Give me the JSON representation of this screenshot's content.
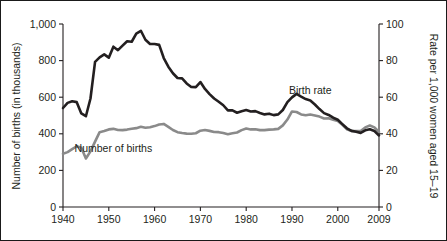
{
  "chart_data": {
    "type": "line",
    "title": "",
    "xlabel": "",
    "ylabel": "Number of births (in thousands)",
    "y2label": "Rate per 1,000 women aged 15–19",
    "grid": false,
    "legend_position": "inline-annotations",
    "xlim": [
      1940,
      2009
    ],
    "ylim": [
      0,
      1000
    ],
    "y2lim": [
      0,
      100
    ],
    "x_ticks": [
      "1940",
      "1950",
      "1960",
      "1970",
      "1980",
      "1990",
      "2000",
      "2009"
    ],
    "x_tick_values": [
      1940,
      1950,
      1960,
      1970,
      1980,
      1990,
      2000,
      2009
    ],
    "y_ticks": [
      "0",
      "200",
      "400",
      "600",
      "800",
      "1,000"
    ],
    "y_tick_values": [
      0,
      200,
      400,
      600,
      800,
      1000
    ],
    "y2_ticks": [
      "0",
      "20",
      "40",
      "60",
      "80",
      "100"
    ],
    "y2_tick_values": [
      0,
      20,
      40,
      60,
      80,
      100
    ],
    "x": [
      1940,
      1941,
      1942,
      1943,
      1944,
      1945,
      1946,
      1947,
      1948,
      1949,
      1950,
      1951,
      1952,
      1953,
      1954,
      1955,
      1956,
      1957,
      1958,
      1959,
      1960,
      1961,
      1962,
      1963,
      1964,
      1965,
      1966,
      1967,
      1968,
      1969,
      1970,
      1971,
      1972,
      1973,
      1974,
      1975,
      1976,
      1977,
      1978,
      1979,
      1980,
      1981,
      1982,
      1983,
      1984,
      1985,
      1986,
      1987,
      1988,
      1989,
      1990,
      1991,
      1992,
      1993,
      1994,
      1995,
      1996,
      1997,
      1998,
      1999,
      2000,
      2001,
      2002,
      2003,
      2004,
      2005,
      2006,
      2007,
      2008,
      2009
    ],
    "series": [
      {
        "name": "Birth rate",
        "axis": "right",
        "color": "#231f20",
        "units": "births per 1,000 women aged 15-19",
        "values": [
          54.1,
          56.9,
          57.8,
          57.3,
          51.1,
          49.6,
          59.3,
          79.3,
          81.8,
          83.4,
          81.6,
          87.6,
          85.7,
          88.2,
          90.6,
          90.3,
          94.8,
          96.3,
          91.4,
          89.1,
          89.1,
          88.6,
          81.4,
          76.7,
          73.1,
          70.5,
          70.3,
          67.5,
          65.6,
          65.5,
          68.3,
          64.5,
          61.7,
          59.3,
          57.5,
          55.6,
          52.8,
          52.8,
          51.5,
          52.3,
          53.0,
          52.2,
          52.4,
          51.4,
          50.6,
          51.0,
          50.2,
          50.6,
          53.0,
          57.3,
          59.9,
          61.8,
          60.3,
          59.0,
          58.2,
          56.0,
          53.5,
          51.3,
          50.3,
          48.8,
          47.7,
          45.3,
          43.0,
          41.6,
          41.1,
          40.5,
          41.9,
          42.5,
          41.5,
          39.1
        ]
      },
      {
        "name": "Number of births",
        "axis": "left",
        "color": "#8a8a8a",
        "units": "thousands of births",
        "values": [
          291,
          300,
          316,
          332,
          324,
          265,
          304,
          357,
          409,
          415,
          424,
          427,
          421,
          420,
          423,
          428,
          431,
          438,
          433,
          436,
          442,
          451,
          454,
          438,
          421,
          409,
          404,
          401,
          400,
          403,
          417,
          421,
          416,
          410,
          409,
          404,
          398,
          403,
          407,
          420,
          429,
          424,
          425,
          420,
          420,
          423,
          424,
          427,
          446,
          478,
          522,
          519,
          506,
          501,
          505,
          500,
          494,
          484,
          485,
          477,
          470,
          449,
          425,
          415,
          415,
          415,
          435,
          445,
          435,
          410
        ]
      }
    ],
    "annotations": [
      {
        "text": "Birth rate",
        "x": 1994,
        "y_axis": "right",
        "y": 62
      },
      {
        "text": "Number of births",
        "x": 1951,
        "y_axis": "left",
        "y": 300
      }
    ]
  },
  "axes": {
    "left_title": "Number of births (in thousands)",
    "right_title": "Rate per 1,000 women aged 15–19"
  }
}
